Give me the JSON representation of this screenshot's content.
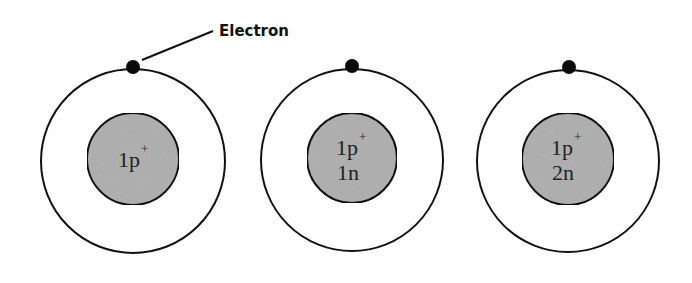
{
  "diagram": {
    "title": "",
    "colors": {
      "background": "#ffffff",
      "stroke": "#111111",
      "nucleus_fill": "#b3b3b3",
      "electron": "#0a0a0a"
    },
    "callout": {
      "label": "Electron"
    },
    "atoms": [
      {
        "name": "atom-protium",
        "nucleus_line1": "1p",
        "nucleus_line1_sup": "+",
        "nucleus_line2": ""
      },
      {
        "name": "atom-deuterium",
        "nucleus_line1": "1p",
        "nucleus_line1_sup": "+",
        "nucleus_line2": "1n"
      },
      {
        "name": "atom-tritium",
        "nucleus_line1": "1p",
        "nucleus_line1_sup": "+",
        "nucleus_line2": "2n"
      }
    ]
  }
}
